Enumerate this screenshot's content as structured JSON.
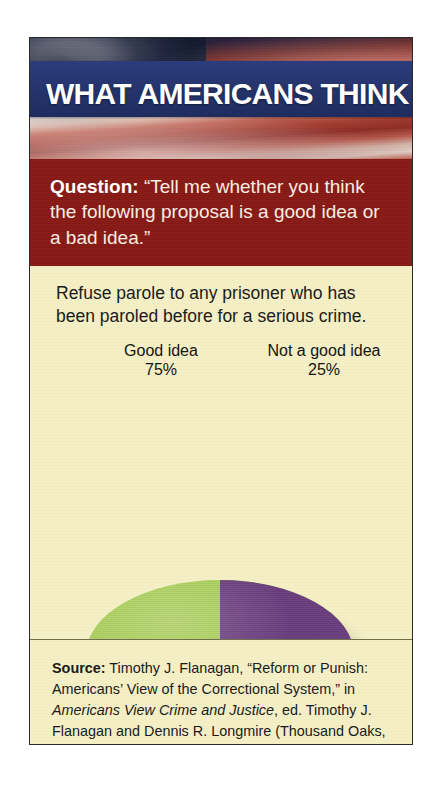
{
  "card": {
    "header": {
      "banner_title": "WHAT AMERICANS THINK",
      "background_image": "american-flag-photo",
      "banner_color": "#2A3B77"
    },
    "question_panel": {
      "label": "Question:",
      "text": "“Tell me whether you think the following proposal is a good idea or a bad idea.”",
      "background_color": "#8A1A16"
    },
    "proposal": {
      "text": "Refuse parole to any prisoner who has been paroled before for a serious crime."
    },
    "source": {
      "label": "Source:",
      "text_part1": " Timothy J. Flanagan, “Reform or Punish: Americans’ View of the Correctional System,” in ",
      "italic_title": "Americans View Crime and Justice",
      "text_part2": ", ed. Timothy J. Flanagan and Dennis R. Longmire (Thousand Oaks, CA: Sage, 1996), 84."
    },
    "background_color": "#F5EFC5"
  },
  "chart_data": {
    "type": "pie",
    "title": "Refuse parole to any prisoner who has been paroled before for a serious crime.",
    "categories": [
      "Good idea",
      "Not a good idea"
    ],
    "values": [
      75,
      25
    ],
    "value_labels": [
      "75%",
      "25%"
    ],
    "colors": [
      "#A8CE58",
      "#6B3D7E"
    ],
    "unit": "percent",
    "style": "3d-pie",
    "legend": "none",
    "labels_position": "above-slices-with-leader-lines",
    "slices": [
      {
        "label": "Good idea",
        "value": 75,
        "display": "75%",
        "color": "#A8CE58"
      },
      {
        "label": "Not a good idea",
        "value": 25,
        "display": "25%",
        "color": "#6B3D7E"
      }
    ]
  }
}
